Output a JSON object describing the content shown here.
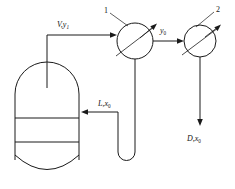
{
  "diagram": {
    "background_color": "#ffffff",
    "line_color": "#1a1a1a",
    "width": 235,
    "height": 189,
    "labels": {
      "vapor_feed": {
        "text": "V,y",
        "subscript": "1"
      },
      "vapor_out": {
        "text": "y",
        "subscript": "0"
      },
      "liquid_reflux": {
        "text": "L,x",
        "subscript": "0"
      },
      "distillate": {
        "text": "D,x",
        "subscript": "0"
      },
      "stage_one": {
        "text": "1"
      },
      "stage_two": {
        "text": "2"
      }
    },
    "nodes": [
      {
        "name": "distillation-column",
        "type": "vessel",
        "cx": 47,
        "cy": 120
      },
      {
        "name": "stage-1-unit",
        "type": "circle-valve",
        "cx": 135,
        "cy": 41,
        "r": 18
      },
      {
        "name": "stage-2-unit",
        "type": "circle-valve",
        "cx": 200,
        "cy": 41,
        "r": 16
      }
    ],
    "streams": [
      {
        "name": "vapor-feed-stream",
        "from": "distillation-column",
        "to": "stage-1-unit",
        "label": "V,y1"
      },
      {
        "name": "interstage-vapor-stream",
        "from": "stage-1-unit",
        "to": "stage-2-unit",
        "label": "y0"
      },
      {
        "name": "reflux-stream",
        "from": "stage-1-unit",
        "to": "distillation-column",
        "label": "L,x0"
      },
      {
        "name": "distillate-stream",
        "from": "stage-2-unit",
        "to": "product",
        "label": "D,x0"
      }
    ]
  }
}
